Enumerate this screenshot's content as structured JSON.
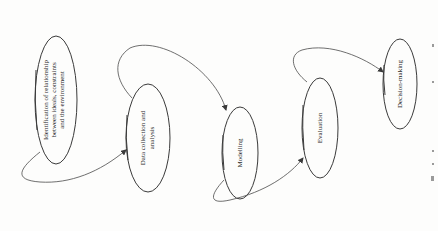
{
  "diagram": {
    "type": "flowchart",
    "orientation": "rotated-90-ccw",
    "nodes": [
      {
        "id": "n1",
        "lines": [
          "Identification of relationship",
          "between ideals, constraints",
          "and the environment"
        ]
      },
      {
        "id": "n2",
        "lines": [
          "Data collection and",
          "analysis"
        ]
      },
      {
        "id": "n3",
        "lines": [
          "Modelling"
        ]
      },
      {
        "id": "n4",
        "lines": [
          "Evaluation"
        ]
      },
      {
        "id": "n5",
        "lines": [
          "Decision-making"
        ]
      }
    ],
    "edges": [
      {
        "from": "n1",
        "to": "n2"
      },
      {
        "from": "n2",
        "to": "n3"
      },
      {
        "from": "n3",
        "to": "n4"
      },
      {
        "from": "n4",
        "to": "n5"
      }
    ],
    "colors": {
      "stroke": "#3a3a3a",
      "text": "#2a2a2a",
      "background": "#fdfdfc"
    }
  }
}
